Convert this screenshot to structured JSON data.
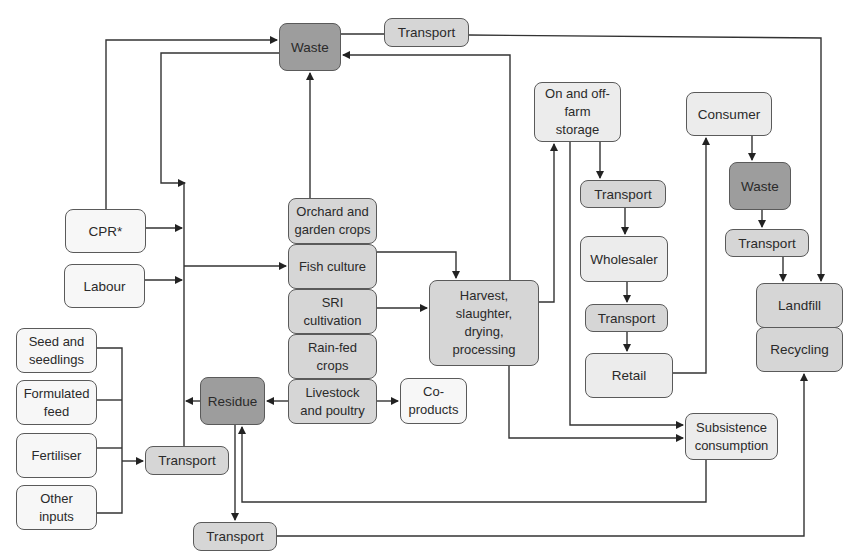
{
  "diagram": {
    "nodes": {
      "waste_top": "Waste",
      "transport_top": "Transport",
      "cpr": "CPR*",
      "labour": "Labour",
      "seed": "Seed and\nseedlings",
      "feed": "Formulated\nfeed",
      "fertiliser": "Fertiliser",
      "other_inputs": "Other\ninputs",
      "transport_inputs": "Transport",
      "residue": "Residue",
      "transport_residue": "Transport",
      "orchard": "Orchard and\ngarden crops",
      "fish": "Fish culture",
      "sri": "SRI\ncultivation",
      "rainfed": "Rain-fed\ncrops",
      "livestock": "Livestock\nand poultry",
      "coproducts": "Co-\nproducts",
      "harvest": "Harvest,\nslaughter,\ndrying,\nprocessing",
      "storage": "On and off-\nfarm\nstorage",
      "transport_storage": "Transport",
      "wholesaler": "Wholesaler",
      "transport_wholesale": "Transport",
      "retail": "Retail",
      "consumer": "Consumer",
      "waste_consumer": "Waste",
      "transport_consumer": "Transport",
      "landfill": "Landfill",
      "recycling": "Recycling",
      "subsistence": "Subsistence\nconsumption"
    },
    "edges": [
      {
        "from": "CPR*",
        "to": "Waste"
      },
      {
        "from": "Waste",
        "to": "Transport",
        "via": "input bus"
      },
      {
        "from": "CPR*",
        "to": "input bus"
      },
      {
        "from": "Labour",
        "to": "input bus"
      },
      {
        "from": "input bus",
        "to": "Fish culture"
      },
      {
        "from": "Seed and seedlings / Formulated feed / Fertiliser / Other inputs",
        "to": "Transport"
      },
      {
        "from": "Transport",
        "to": "input bus"
      },
      {
        "from": "Orchard and garden crops",
        "to": "Waste"
      },
      {
        "from": "Fish culture",
        "to": "Harvest, slaughter, drying, processing"
      },
      {
        "from": "SRI cultivation",
        "to": "Harvest, slaughter, drying, processing"
      },
      {
        "from": "Livestock and poultry",
        "to": "Residue"
      },
      {
        "from": "Livestock and poultry",
        "to": "Co-products"
      },
      {
        "from": "Residue",
        "to": "input bus"
      },
      {
        "from": "Residue",
        "to": "Transport"
      },
      {
        "from": "Transport",
        "to": "Recycling"
      },
      {
        "from": "Harvest, slaughter, drying, processing",
        "to": "On and off-farm storage"
      },
      {
        "from": "Harvest, slaughter, drying, processing",
        "to": "Waste"
      },
      {
        "from": "Harvest, slaughter, drying, processing",
        "to": "Subsistence consumption"
      },
      {
        "from": "On and off-farm storage",
        "to": "Transport"
      },
      {
        "from": "On and off-farm storage",
        "to": "Subsistence consumption"
      },
      {
        "from": "Transport",
        "to": "Wholesaler"
      },
      {
        "from": "Wholesaler",
        "to": "Transport"
      },
      {
        "from": "Transport",
        "to": "Retail"
      },
      {
        "from": "Retail",
        "to": "Consumer"
      },
      {
        "from": "Consumer",
        "to": "Waste"
      },
      {
        "from": "Waste",
        "to": "Transport"
      },
      {
        "from": "Transport",
        "to": "Landfill"
      },
      {
        "from": "Transport (top)",
        "to": "Landfill"
      },
      {
        "from": "Subsistence consumption",
        "to": "Residue"
      }
    ],
    "colors": {
      "light": "#ececec",
      "mid": "#d6d6d6",
      "dark": "#9d9d9d",
      "line": "#333333"
    }
  }
}
